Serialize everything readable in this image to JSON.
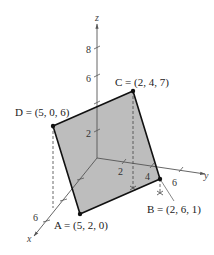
{
  "figure": {
    "type": "3d-parallelogram",
    "axes": {
      "x": {
        "label": "x",
        "ticks": [
          {
            "value": "6",
            "show_label": true
          }
        ]
      },
      "y": {
        "label": "y",
        "ticks": [
          {
            "value": "2"
          },
          {
            "value": "4"
          },
          {
            "value": "6"
          }
        ]
      },
      "z": {
        "label": "z",
        "ticks": [
          {
            "value": "2"
          },
          {
            "value": "6"
          },
          {
            "value": "8"
          }
        ]
      }
    },
    "points": {
      "A": {
        "name": "A",
        "coords": "(5, 2, 0)",
        "label": "A = (5, 2, 0)"
      },
      "B": {
        "name": "B",
        "coords": "(2, 6, 1)",
        "label": "B = (2, 6, 1)"
      },
      "C": {
        "name": "C",
        "coords": "(2, 4, 7)",
        "label": "C = (2, 4, 7)"
      },
      "D": {
        "name": "D",
        "coords": "(5, 0, 6)",
        "label": "D = (5, 0, 6)"
      }
    },
    "colors": {
      "fill": "#bdbdbd",
      "edge": "#111111",
      "axis": "#555555",
      "dashed": "#444444"
    }
  }
}
